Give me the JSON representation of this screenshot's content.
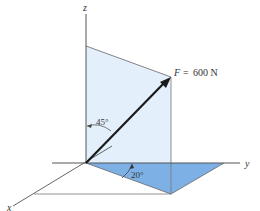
{
  "figure": {
    "type": "3d-force-vector-diagram",
    "axes": {
      "x_label": "x",
      "y_label": "y",
      "z_label": "z"
    },
    "force": {
      "symbol": "F",
      "equals": "=",
      "magnitude": "600 N",
      "full_label": "F = 600 N"
    },
    "angles": {
      "from_z_axis": "45°",
      "from_y_axis_in_xy_plane": "20°"
    },
    "colors": {
      "vertical_plane_fill": "#e3f0fb",
      "horizontal_triangle_fill": "#7db1e6",
      "axis_line": "#555555",
      "force_arrow": "#1a1a1a",
      "construction_line": "#777777"
    }
  }
}
